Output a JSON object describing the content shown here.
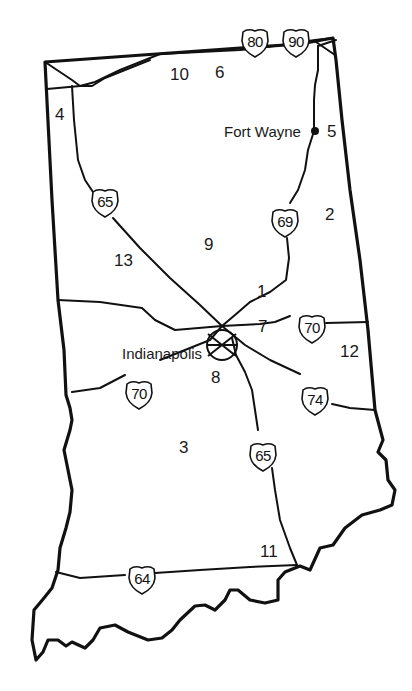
{
  "map": {
    "state": "Indiana",
    "cities": [
      {
        "name": "Fort Wayne",
        "label": "Fort Wayne"
      },
      {
        "name": "Indianapolis",
        "label": "Indianapolis"
      }
    ],
    "region_numbers": [
      "1",
      "2",
      "3",
      "4",
      "5",
      "6",
      "7",
      "8",
      "9",
      "10",
      "11",
      "12",
      "13"
    ],
    "interstates": [
      {
        "id": "i80",
        "number": "80"
      },
      {
        "id": "i90",
        "number": "90"
      },
      {
        "id": "i65-north",
        "number": "65"
      },
      {
        "id": "i69",
        "number": "69"
      },
      {
        "id": "i70-east",
        "number": "70"
      },
      {
        "id": "i70-west",
        "number": "70"
      },
      {
        "id": "i74",
        "number": "74"
      },
      {
        "id": "i65-south",
        "number": "65"
      },
      {
        "id": "i64",
        "number": "64"
      }
    ],
    "colors": {
      "lines": "#111111",
      "background": "#ffffff"
    }
  }
}
